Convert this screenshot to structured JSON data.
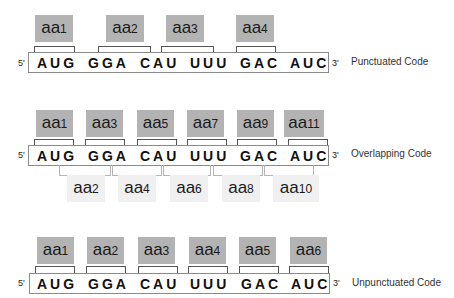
{
  "rows": [
    {
      "caption": "Punctuated Code",
      "five_prime": "5'",
      "three_prime": "3'",
      "codons": [
        "AUG",
        "GGA",
        "CAU",
        "UUU",
        "GAC",
        "AUC"
      ],
      "amino_acids_top": [
        {
          "prefix": "aa",
          "num": "1"
        },
        {
          "prefix": "aa",
          "num": "2"
        },
        {
          "prefix": "aa",
          "num": "3"
        },
        {
          "prefix": "aa",
          "num": "4"
        }
      ]
    },
    {
      "caption": "Overlapping Code",
      "five_prime": "5'",
      "three_prime": "3'",
      "codons": [
        "AUG",
        "GGA",
        "CAU",
        "UUU",
        "GAC",
        "AUC"
      ],
      "amino_acids_top": [
        {
          "prefix": "aa",
          "num": "1"
        },
        {
          "prefix": "aa",
          "num": "3"
        },
        {
          "prefix": "aa",
          "num": "5"
        },
        {
          "prefix": "aa",
          "num": "7"
        },
        {
          "prefix": "aa",
          "num": "9"
        },
        {
          "prefix": "aa",
          "num": "11"
        }
      ],
      "amino_acids_bottom": [
        {
          "prefix": "aa",
          "num": "2"
        },
        {
          "prefix": "aa",
          "num": "4"
        },
        {
          "prefix": "aa",
          "num": "6"
        },
        {
          "prefix": "aa",
          "num": "8"
        },
        {
          "prefix": "aa",
          "num": "10"
        }
      ]
    },
    {
      "caption": "Unpunctuated Code",
      "five_prime": "5'",
      "three_prime": "3'",
      "codons": [
        "AUG",
        "GGA",
        "CAU",
        "UUU",
        "GAC",
        "AUC"
      ],
      "amino_acids_top": [
        {
          "prefix": "aa",
          "num": "1"
        },
        {
          "prefix": "aa",
          "num": "2"
        },
        {
          "prefix": "aa",
          "num": "3"
        },
        {
          "prefix": "aa",
          "num": "4"
        },
        {
          "prefix": "aa",
          "num": "5"
        },
        {
          "prefix": "aa",
          "num": "6"
        }
      ]
    }
  ],
  "colors": {
    "aa_box": "#b3b3b3",
    "aa_box_light": "#f0f0f0",
    "strand_border": "#8a8a8a"
  }
}
